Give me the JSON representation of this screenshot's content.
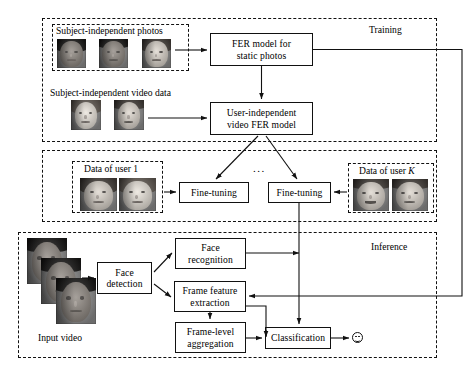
{
  "figure": {
    "type": "flow-diagram"
  },
  "stages": {
    "training": {
      "label": "Training",
      "groups": {
        "photos": {
          "label": "Subject-independent photos",
          "thumbnails": [
            "female-dark-face",
            "male-dark-face",
            "female-light-face"
          ]
        },
        "videos": {
          "label": "Subject-independent video data",
          "thumbnails": [
            "female-light-face",
            "male-light-face"
          ]
        }
      },
      "boxes": [
        {
          "id": "fer-static",
          "line1": "FER model for",
          "line2": "static photos"
        },
        {
          "id": "user-independent",
          "line1": "User-independent",
          "line2": "video FER model"
        }
      ]
    },
    "finetuning": {
      "ellipsis": "...",
      "groups": [
        {
          "id": "user-1",
          "label": "Data of user 1",
          "label_italic_tail": "",
          "thumbnails": [
            "female-profile-face",
            "female-front-face"
          ]
        },
        {
          "id": "user-k",
          "label": "Data of user K",
          "label_italic_tail": "K",
          "thumbnails": [
            "male-smiling-face",
            "male-neutral-face"
          ]
        }
      ],
      "boxes": [
        {
          "id": "fine-tuning-1",
          "line1": "Fine-tuning",
          "line2": ""
        },
        {
          "id": "fine-tuning-k",
          "line1": "Fine-tuning",
          "line2": ""
        }
      ]
    },
    "inference": {
      "label": "Inference",
      "input": {
        "label": "Input video",
        "thumbnails": [
          "male-frame-1",
          "male-frame-2",
          "male-frame-3"
        ]
      },
      "boxes": [
        {
          "id": "face-detection",
          "line1": "Face",
          "line2": "detection"
        },
        {
          "id": "face-recognition",
          "line1": "Face",
          "line2": "recognition"
        },
        {
          "id": "frame-feature",
          "line1": "Frame feature",
          "line2": "extraction"
        },
        {
          "id": "frame-aggregation",
          "line1": "Frame-level",
          "line2": "aggregation"
        },
        {
          "id": "classification",
          "line1": "Classification",
          "line2": ""
        }
      ],
      "output": {
        "id": "emotion-output",
        "icon": "smiley-face-icon"
      }
    }
  },
  "colors": {
    "stroke": "#111111",
    "background": "#ffffff",
    "box_fill": "#ffffff"
  }
}
